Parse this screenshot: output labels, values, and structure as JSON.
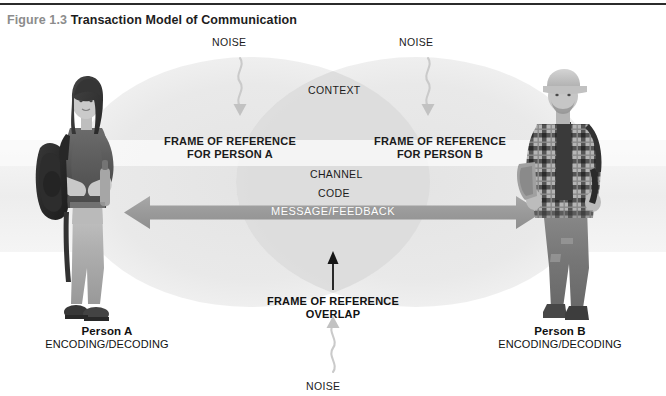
{
  "caption": {
    "number": "Figure 1.3",
    "title": "Transaction Model of Communication"
  },
  "diagram": {
    "noise_top_left": "NOISE",
    "noise_top_right": "NOISE",
    "noise_bottom": "NOISE",
    "context": "CONTEXT",
    "frame_a_line1": "FRAME OF REFERENCE",
    "frame_a_line2": "FOR PERSON A",
    "frame_b_line1": "FRAME OF REFERENCE",
    "frame_b_line2": "FOR PERSON B",
    "channel": "CHANNEL",
    "code": "CODE",
    "message_feedback": "MESSAGE/FEEDBACK",
    "overlap_line1": "FRAME OF REFERENCE",
    "overlap_line2": "OVERLAP"
  },
  "person_a": {
    "name": "Person A",
    "role": "ENCODING/DECODING"
  },
  "person_b": {
    "name": "Person B",
    "role": "ENCODING/DECODING"
  },
  "colors": {
    "caption_number": "#8c8c8c",
    "caption_title": "#1d1d1d",
    "rule": "#2b2b2b",
    "ellipse_fill": "#e8e8e8",
    "ellipse_overlap": "#dcdcdc",
    "context_band": "#f0f0f0",
    "arrow_bar": "#9a9a9a",
    "arrow_text": "#ffffff",
    "noise_squiggle": "#c9c9c9",
    "overlap_arrow": "#151515"
  }
}
